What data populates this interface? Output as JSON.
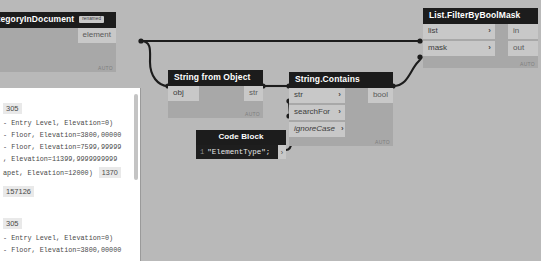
{
  "app": {
    "name": "dynamo-graph-canvas",
    "background_color": "#b9b9b9"
  },
  "nodes": {
    "all_elements": {
      "title": "sOfCategoryInDocument",
      "badge": "renamed",
      "outputs": [
        {
          "label": "element"
        }
      ],
      "footer": "AUTO"
    },
    "string_from_object": {
      "title": "String from Object",
      "inputs": [
        {
          "label": "obj"
        }
      ],
      "outputs": [
        {
          "label": "str"
        }
      ],
      "footer": "AUTO"
    },
    "string_contains": {
      "title": "String.Contains",
      "inputs": [
        {
          "label": "str",
          "chevron": "›",
          "italic": false
        },
        {
          "label": "searchFor",
          "chevron": "›",
          "italic": false
        },
        {
          "label": "ignoreCase",
          "chevron": "›",
          "italic": true
        }
      ],
      "outputs": [
        {
          "label": "bool"
        }
      ],
      "footer": "AUTO"
    },
    "code_block": {
      "title": "Code Block",
      "line_number": "1",
      "code": "\"ElementType\";",
      "output_chevron": "›"
    },
    "filter_by_bool_mask": {
      "title": "List.FilterByBoolMask",
      "inputs": [
        {
          "label": "list",
          "chevron": "›"
        },
        {
          "label": "mask",
          "chevron": "›"
        }
      ],
      "outputs": [
        {
          "label": "in"
        },
        {
          "label": "out"
        }
      ],
      "footer": "AUTO"
    }
  },
  "preview": {
    "groups": [
      {
        "index": "305",
        "rows": [
          "- Entry Level, Elevation=0)",
          "- Floor, Elevation=3800,00000",
          "- Floor, Elevation=7599,99999",
          ", Elevation=11399,9999999999"
        ],
        "last_row": "apet, Elevation=12000)",
        "last_row_badge": "1370",
        "trailing_badge": "157126"
      },
      {
        "index": "305",
        "rows": [
          "- Entry Level, Elevation=0)",
          "- Floor, Elevation=3800,00000"
        ]
      }
    ]
  },
  "colors": {
    "node_header": "#1c1c1c",
    "node_body": "#a8a8a8",
    "port": "#c8c8c8",
    "wire": "#1c1c1c",
    "canvas": "#b9b9b9",
    "code_block_bg": "#1e1e1e"
  }
}
